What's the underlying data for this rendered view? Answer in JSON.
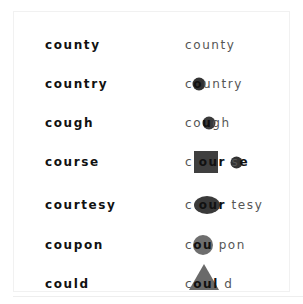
{
  "rows": [
    {
      "left": "county",
      "right": {
        "pre": "county",
        "hl": "",
        "post": "",
        "shape": "none"
      }
    },
    {
      "left": "country",
      "right": {
        "pre": "c",
        "hl": "o",
        "post": "untry",
        "shape": "small-circle"
      }
    },
    {
      "left": "cough",
      "right": {
        "pre": "co",
        "hl": "u",
        "post": "gh",
        "shape": "small-circle"
      }
    },
    {
      "left": "course",
      "right": {
        "pre": "c",
        "hl": "our",
        "post": "s",
        "tail": "e",
        "shape": "square"
      }
    },
    {
      "left": "courtesy",
      "right": {
        "pre": "c",
        "hl": "our",
        "post": "tesy",
        "shape": "ellipse"
      }
    },
    {
      "left": "coupon",
      "right": {
        "pre": "c",
        "hl": "ou",
        "post": "pon",
        "shape": "circle"
      }
    },
    {
      "left": "could",
      "right": {
        "pre": "c",
        "hl": "oul",
        "post": "d",
        "shape": "triangle"
      }
    }
  ],
  "colors": {
    "shape_dark": "#3a3a3a",
    "shape_gray": "#6e6e6e",
    "text_left": "#111111",
    "text_right": "#555555"
  }
}
